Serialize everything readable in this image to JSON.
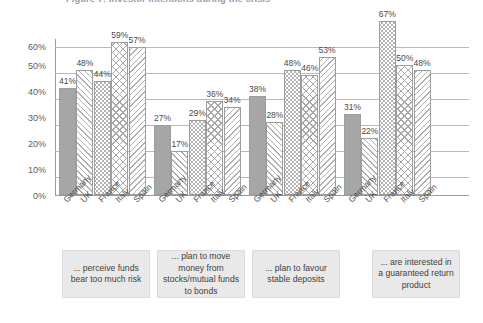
{
  "chart_data": {
    "type": "bar",
    "title": "Figure 7: Investor intentions during the crisis",
    "xlabel": "",
    "ylabel": "",
    "ylim": [
      0,
      60
    ],
    "yticks": [
      "0%",
      "10%",
      "20%",
      "30%",
      "40%",
      "50%",
      "60%"
    ],
    "grid": true,
    "legend_position": "none",
    "categories": [
      "Germany",
      "UK",
      "France",
      "Italy",
      "Spain"
    ],
    "groups": [
      {
        "caption": "... perceive funds bear too much risk",
        "values": [
          41,
          48,
          44,
          59,
          57
        ],
        "labels": [
          "41%",
          "48%",
          "44%",
          "59%",
          "57%"
        ]
      },
      {
        "caption": "... plan to move money from stocks/mutual funds to bonds",
        "values": [
          27,
          17,
          29,
          36,
          34
        ],
        "labels": [
          "27%",
          "17%",
          "29%",
          "36%",
          "34%"
        ]
      },
      {
        "caption": "... plan to favour stable deposits",
        "values": [
          38,
          28,
          48,
          46,
          53
        ],
        "labels": [
          "38%",
          "28%",
          "48%",
          "46%",
          "53%"
        ]
      },
      {
        "caption": "... are interested in a guaranteed return product",
        "values": [
          31,
          22,
          67,
          50,
          48
        ],
        "labels": [
          "31%",
          "22%",
          "67%",
          "50%",
          "48%"
        ]
      }
    ],
    "series_patterns": [
      "solid-grey",
      "diagonal-hatch",
      "wave-zigzag",
      "crosshatch",
      "diagonal-hatch-reverse"
    ],
    "colors": {
      "bar_fill": "#a6a6a6",
      "bar_outline": "#9e9e9e",
      "gridline": "#b9b9b9",
      "axis": "#9a9a9a",
      "caption_box": "#e9e9e9",
      "text": "#3b3b3b"
    }
  }
}
